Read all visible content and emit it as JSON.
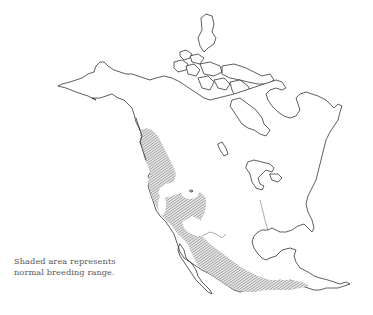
{
  "map": {
    "region": "North America",
    "style": "outline map with hatched shading",
    "colors": {
      "background": "#ffffff",
      "outline": "#1a1a1a",
      "hatch": "#6b6b6b",
      "caption": "#555555"
    },
    "legend": {
      "line1": "Shaded area represents",
      "line2": "normal breeding range."
    },
    "shaded_regions": [
      "Pacific coast from southeast Alaska through British Columbia",
      "Western United States interior (Great Basin, Rockies)",
      "Southern Great Plains / Texas",
      "Mexico to Central America"
    ]
  }
}
